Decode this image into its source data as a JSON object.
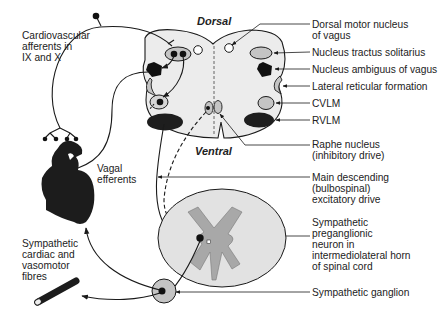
{
  "colors": {
    "line": "#1a1a1a",
    "medulla_fill": "#ececec",
    "nucleus_fill": "#c4c4c4",
    "dark_fill": "#1e1e1e",
    "grey_matter": "#a8a8a8",
    "cord_fill": "#e2e2e2"
  },
  "medulla": {
    "dorsal_label": "Dorsal",
    "ventral_label": "Ventral"
  },
  "labels": {
    "cv_afferents": [
      "Cardiovascular",
      "afferents in",
      "IX and X"
    ],
    "vagal_efferents": [
      "Vagal",
      "efferents"
    ],
    "sympathetic_fibres": [
      "Sympathetic",
      "cardiac and",
      "vasomotor",
      "fibres"
    ],
    "dorsal_motor": [
      "Dorsal motor nucleus",
      "of vagus"
    ],
    "nts": "Nucleus tractus solitarius",
    "ambiguus": "Nucleus ambiguus of vagus",
    "lateral_reticular": "Lateral reticular formation",
    "cvlm": "CVLM",
    "rvlm": "RVLM",
    "raphe": [
      "Raphe nucleus",
      "(inhibitory drive)"
    ],
    "main_descending": [
      "Main descending",
      "(bulbospinal)",
      "excitatory drive"
    ],
    "preganglionic": [
      "Sympathetic",
      "preganglionic",
      "neuron in",
      "intermediolateral horn",
      "of spinal cord"
    ],
    "ganglion": "Sympathetic ganglion"
  }
}
